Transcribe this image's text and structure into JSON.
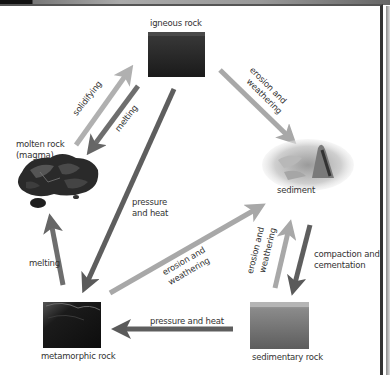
{
  "diagram": {
    "type": "rock-cycle",
    "nodes": {
      "igneous": {
        "label": "igneous rock"
      },
      "magma": {
        "label_line1": "molten rock",
        "label_line2": "(magma)"
      },
      "sediment": {
        "label": "sediment"
      },
      "metamorphic": {
        "label": "metamorphic rock"
      },
      "sedimentary": {
        "label": "sedimentary rock"
      }
    },
    "edges": {
      "magma_to_igneous": {
        "label": "solidifying",
        "color": "#b0b0b0"
      },
      "igneous_to_magma": {
        "label": "melting",
        "color": "#6e6e6e"
      },
      "igneous_to_sediment": {
        "label_line1": "erosion and",
        "label_line2": "weathering",
        "color": "#a8a8a8"
      },
      "igneous_to_metamorphic": {
        "label_line1": "pressure",
        "label_line2": "and heat",
        "color": "#5e5e5e"
      },
      "metamorphic_to_magma": {
        "label": "melting",
        "color": "#6e6e6e"
      },
      "metamorphic_to_sediment": {
        "label_line1": "erosion and",
        "label_line2": "weathering",
        "color": "#a8a8a8"
      },
      "sedimentary_to_sediment": {
        "label_line1": "erosion and",
        "label_line2": "weathering",
        "color": "#a8a8a8"
      },
      "sediment_to_sedimentary": {
        "label_line1": "compaction and",
        "label_line2": "cementation",
        "color": "#5e5e5e"
      },
      "sedimentary_to_metamorphic": {
        "label": "pressure and heat",
        "color": "#5e5e5e"
      }
    }
  }
}
